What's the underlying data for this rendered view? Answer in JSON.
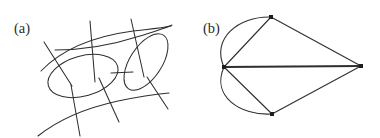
{
  "figure": {
    "background_color": "#ffffff",
    "stroke_color": "#2f2f33",
    "label_color": "#2b2b2b",
    "width": 380,
    "height": 138,
    "panels": [
      {
        "id": "panel-a",
        "label": "(a)",
        "label_x": 14,
        "label_y": 33,
        "caption_role": "hand-drawn curve arrangement sketch",
        "description": "Two tilted ellipses linked by a short horizontal bridge, overlaid by a lattice of near-vertical strokes and long sweeping horizontal curves",
        "ellipses": [
          {
            "name": "left-ellipse",
            "cx": 83,
            "cy": 76,
            "rx": 36,
            "ry": 20,
            "rotation": -16
          },
          {
            "name": "right-ellipse",
            "cx": 146,
            "cy": 62,
            "rx": 32,
            "ry": 16,
            "rotation": -57
          }
        ],
        "bridge_segment": {
          "name": "ellipse-bridge",
          "x1": 111,
          "y1": 73,
          "x2": 133,
          "y2": 72
        },
        "vertical_strokes": [
          {
            "name": "vertical-stroke-1",
            "x1": 45,
            "y1": 43,
            "x2": 71,
            "y2": 85
          },
          {
            "name": "vertical-stroke-2",
            "x1": 91,
            "y1": 22,
            "x2": 94,
            "y2": 80
          },
          {
            "name": "vertical-stroke-3",
            "x1": 132,
            "y1": 20,
            "x2": 143,
            "y2": 76
          },
          {
            "name": "vertical-stroke-4",
            "x1": 72,
            "y1": 86,
            "x2": 79,
            "y2": 135
          },
          {
            "name": "vertical-stroke-5",
            "x1": 100,
            "y1": 79,
            "x2": 118,
            "y2": 121
          },
          {
            "name": "vertical-stroke-6",
            "x1": 148,
            "y1": 78,
            "x2": 167,
            "y2": 108
          }
        ],
        "horizontal_curves": [
          {
            "name": "upper-sweep-curve",
            "path": "M 42 70 C 70 44 110 34 164 30"
          },
          {
            "name": "mid-sweep-curve",
            "path": "M 56 48 C 92 47 130 40 170 26"
          },
          {
            "name": "lower-sweep-curve",
            "path": "M 40 135 C 68 116 112 103 165 96"
          }
        ]
      },
      {
        "id": "panel-b",
        "label": "(b)",
        "label_x": 203,
        "label_y": 33,
        "caption_role": "planar graph with four vertices",
        "description": "Kite-shaped graph: four vertices joined by straight edges plus two outward-bowing arcs on the left and one long horizontal spine edge",
        "vertices": [
          {
            "name": "vertex-left",
            "x": 224,
            "y": 67
          },
          {
            "name": "vertex-top",
            "x": 271,
            "y": 17
          },
          {
            "name": "vertex-right",
            "x": 361,
            "y": 66
          },
          {
            "name": "vertex-bottom",
            "x": 272,
            "y": 114
          }
        ],
        "straight_edges": [
          {
            "name": "edge-left-top",
            "x1": 224,
            "y1": 67,
            "x2": 271,
            "y2": 17
          },
          {
            "name": "edge-top-right",
            "x1": 271,
            "y1": 17,
            "x2": 361,
            "y2": 66
          },
          {
            "name": "edge-left-bottom",
            "x1": 224,
            "y1": 67,
            "x2": 272,
            "y2": 114
          },
          {
            "name": "edge-bottom-right",
            "x1": 272,
            "y1": 114,
            "x2": 361,
            "y2": 66
          }
        ],
        "spine_edge": {
          "name": "edge-left-right-spine",
          "x1": 224,
          "y1": 67,
          "x2": 361,
          "y2": 66,
          "thick": true
        },
        "arc_edges": [
          {
            "name": "arc-left-top",
            "path": "M 224 67 C 212 38 238 17 271 17"
          },
          {
            "name": "arc-left-bottom",
            "path": "M 224 67 C 212 96 240 116 272 114"
          }
        ],
        "vertex_dot_size": 4
      }
    ]
  }
}
